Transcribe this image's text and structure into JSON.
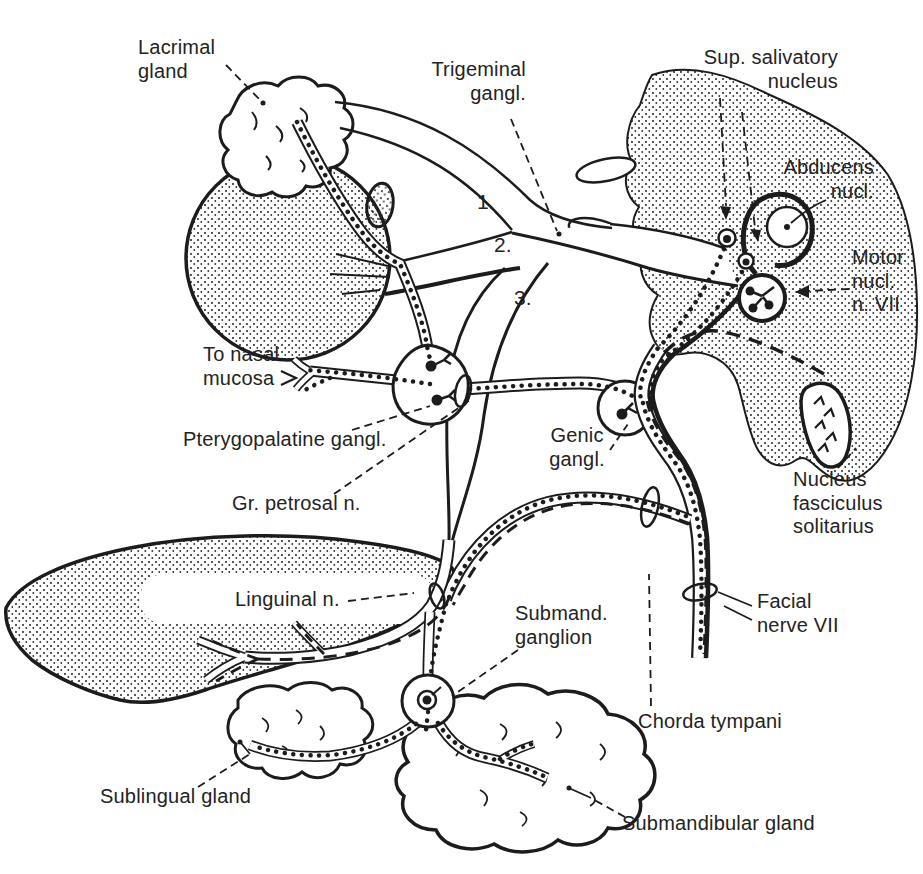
{
  "figure": {
    "ink_color": "#1c1c1c",
    "background_color": "#ffffff"
  },
  "labels": [
    {
      "id": "lacrimal-gland",
      "text": "Lacrimal\ngland"
    },
    {
      "id": "trigeminal-ganglion",
      "text": "Trigeminal\ngangl."
    },
    {
      "id": "sup-salivatory-nucleus",
      "text": "Sup. salivatory\nnucleus"
    },
    {
      "id": "abducens-nucleus",
      "text": "Abducens\nnucl."
    },
    {
      "id": "motor-nucleus-n-vii",
      "text": "Motor\nnucl.\nn. VII"
    },
    {
      "id": "to-nasal-mucosa",
      "text": "To nasal\nmucosa"
    },
    {
      "id": "pterygopalatine-ganglion",
      "text": "Pterygopalatine gangl."
    },
    {
      "id": "gr-petrosal-n",
      "text": "Gr. petrosal n."
    },
    {
      "id": "geniculate-ganglion",
      "text": "Genic\ngangl."
    },
    {
      "id": "nucleus-fasciculus-solitarius",
      "text": "Nucleus\nfasciculus\nsolitarius"
    },
    {
      "id": "linguinal-n",
      "text": "Linguinal n."
    },
    {
      "id": "submandibular-ganglion",
      "text": "Submand.\nganglion"
    },
    {
      "id": "facial-nerve-vii",
      "text": "Facial\nnerve VII"
    },
    {
      "id": "chorda-tympani",
      "text": "Chorda tympani"
    },
    {
      "id": "sublingual-gland",
      "text": "Sublingual gland"
    },
    {
      "id": "submandibular-gland",
      "text": "Submandibular gland"
    }
  ],
  "branch_numbers": [
    {
      "text": "1."
    },
    {
      "text": "2."
    },
    {
      "text": "3."
    }
  ]
}
